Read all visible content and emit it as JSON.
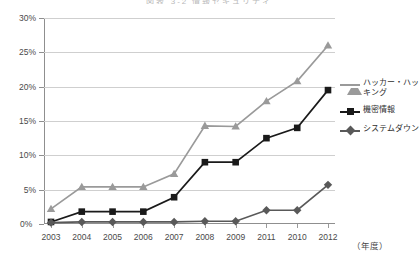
{
  "chart_data": {
    "type": "line",
    "title": "図表 3-2 情報セキュリティ",
    "xlabel": "（年度）",
    "ylabel": "",
    "categories": [
      "2003",
      "2004",
      "2005",
      "2006",
      "2007",
      "2008",
      "2009",
      "2011",
      "2010",
      "2012"
    ],
    "ylim": [
      0,
      30
    ],
    "ytick_labels": [
      "0%",
      "5%",
      "10%",
      "15%",
      "20%",
      "25%",
      "30%"
    ],
    "ytick_values": [
      0,
      5,
      10,
      15,
      20,
      25,
      30
    ],
    "grid": true,
    "legend_position": "right",
    "series": [
      {
        "name": "ハッカー・ハッキング",
        "marker": "triangle",
        "color": "#9a9a9a",
        "values": [
          2.2,
          5.4,
          5.4,
          5.4,
          7.3,
          14.3,
          14.2,
          17.9,
          20.8,
          26.0
        ]
      },
      {
        "name": "機密情報",
        "marker": "square",
        "color": "#1a1a1a",
        "values": [
          0.3,
          1.8,
          1.8,
          1.8,
          3.9,
          9.0,
          9.0,
          12.5,
          14.0,
          19.5
        ]
      },
      {
        "name": "システムダウン",
        "marker": "diamond",
        "color": "#595959",
        "values": [
          0.2,
          0.3,
          0.3,
          0.3,
          0.3,
          0.4,
          0.4,
          2.0,
          2.0,
          5.7
        ]
      }
    ]
  },
  "legend": {
    "items": [
      {
        "label": "ハッカー・ハッキング",
        "marker": "triangle-marker-icon",
        "color": "#9a9a9a"
      },
      {
        "label": "機密情報",
        "marker": "square-marker-icon",
        "color": "#1a1a1a"
      },
      {
        "label": "システムダウン",
        "marker": "diamond-marker-icon",
        "color": "#595959"
      }
    ]
  },
  "axis": {
    "y_zero_label": "0%",
    "x_unit_label": "（年度）"
  }
}
